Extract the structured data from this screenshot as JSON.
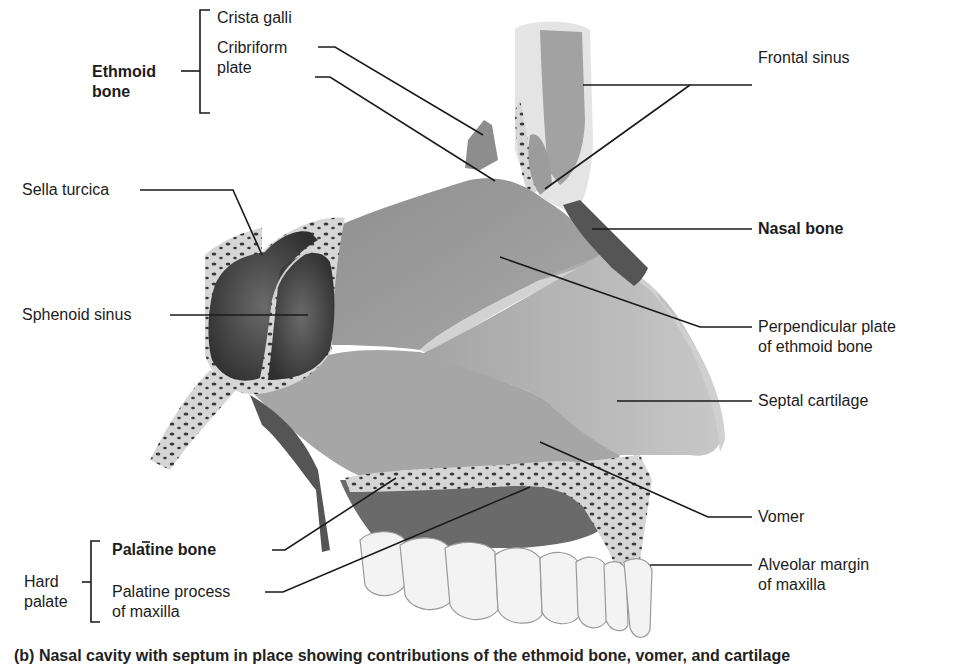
{
  "figure": {
    "groups": {
      "ethmoid_bone": "Ethmoid\nbone",
      "hard_palate": "Hard\npalate"
    },
    "labels": {
      "crista_galli": "Crista galli",
      "cribriform_plate": "Cribriform\nplate",
      "sella_turcica": "Sella turcica",
      "sphenoid_sinus": "Sphenoid sinus",
      "frontal_sinus": "Frontal sinus",
      "nasal_bone": "Nasal bone",
      "perpendicular_plate": "Perpendicular plate\nof ethmoid bone",
      "septal_cartilage": "Septal cartilage",
      "vomer": "Vomer",
      "palatine_bone": "Palatine bone",
      "palatine_process": "Palatine process\nof maxilla",
      "alveolar_margin": "Alveolar margin\nof maxilla"
    },
    "caption": "(b) Nasal cavity with septum in place showing contributions of the ethmoid bone, vomer, and cartilage",
    "colors": {
      "line": "#1a1a1a",
      "bone_light": "#bdbdbd",
      "bone_mid": "#9a9a9a",
      "bone_dark": "#5e5e5e",
      "sinus": "#3f3f3f",
      "spongy": "#d9d9d9",
      "teeth": "#f2f2f2"
    }
  }
}
